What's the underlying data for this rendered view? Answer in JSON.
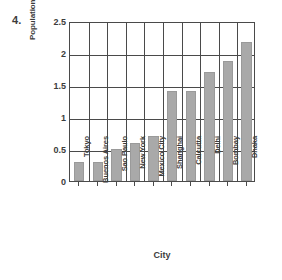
{
  "question_number": "4.",
  "chart_data": {
    "type": "bar",
    "title": "",
    "xlabel": "City",
    "ylabel": "Population Growth in Millions",
    "categories": [
      "Tokyo",
      "Buenos Aires",
      "Sao Paulo",
      "New York",
      "Mexico City",
      "Shanghai",
      "Calcutta",
      "Delhi",
      "Bombay",
      "Dhaka"
    ],
    "values": [
      0.3,
      0.3,
      0.5,
      0.6,
      0.7,
      1.4,
      1.4,
      1.7,
      1.88,
      2.17
    ],
    "ylim": [
      0,
      2.5
    ],
    "ytick_labels": [
      "0",
      "0.5",
      "1",
      "1.5",
      "2",
      "2.5"
    ],
    "ytick_values": [
      0,
      0.5,
      1,
      1.5,
      2,
      2.5
    ],
    "grid": true,
    "legend": false,
    "bar_color": "#a9a9a9",
    "axis_color": "#4a4a4a",
    "background": "#ffffff"
  }
}
